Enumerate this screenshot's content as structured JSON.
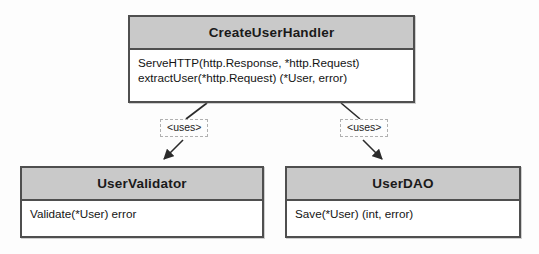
{
  "diagram": {
    "type": "uml-class-diagram",
    "background_color": "#fdfdfd",
    "header_fill": "#c9c9c9",
    "body_fill": "#ffffff",
    "border_color": "#4f4f4f",
    "label_border_color": "#b0b0b0"
  },
  "classes": {
    "handler": {
      "name": "CreateUserHandler",
      "methods": [
        "ServeHTTP(http.Response, *http.Request)",
        "extractUser(*http.Request) (*User, error)"
      ]
    },
    "validator": {
      "name": "UserValidator",
      "methods": [
        "Validate(*User) error"
      ]
    },
    "dao": {
      "name": "UserDAO",
      "methods": [
        "Save(*User) (int, error)"
      ]
    }
  },
  "relationships": [
    {
      "from": "CreateUserHandler",
      "to": "UserValidator",
      "label": "<uses>",
      "style": "dependency",
      "arrow": "filled"
    },
    {
      "from": "CreateUserHandler",
      "to": "UserDAO",
      "label": "<uses>",
      "style": "dependency",
      "arrow": "filled"
    }
  ]
}
